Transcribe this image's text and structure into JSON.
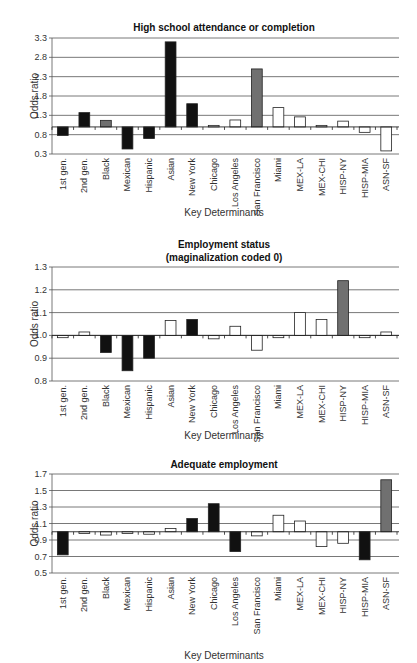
{
  "chart_data": [
    {
      "type": "bar",
      "title": "High school attendance or completion",
      "xlabel": "Key Determinants",
      "ylabel": "Odds ratio",
      "ylim": [
        0.3,
        3.3
      ],
      "yticks": [
        0.3,
        0.8,
        1.3,
        1.8,
        2.3,
        2.8,
        3.3
      ],
      "ytick_labels": [
        "0.3",
        "0.8",
        "1.3",
        "1.8",
        "2.3",
        "2.8",
        "3.3"
      ],
      "baseline": 1.0,
      "grid": true,
      "categories": [
        "1st gen.",
        "2nd gen.",
        "Black",
        "Mexican",
        "Hispanic",
        "Asian",
        "New York",
        "Chicago",
        "Los Angeles",
        "San Francisco",
        "Miami",
        "MEX-LA",
        "MEX-CHI",
        "HISP-NY",
        "HISP-MIA",
        "ASN-SF"
      ],
      "values": [
        0.78,
        1.37,
        1.17,
        0.43,
        0.7,
        3.2,
        1.6,
        1.04,
        1.18,
        2.5,
        1.5,
        1.26,
        1.04,
        1.15,
        0.86,
        0.38
      ],
      "bar_fills": [
        "black",
        "black",
        "gray",
        "black",
        "black",
        "black",
        "black",
        "white",
        "white",
        "gray",
        "white",
        "white",
        "white",
        "white",
        "white",
        "white"
      ]
    },
    {
      "type": "bar",
      "title": "Employment status",
      "subtitle": "(maginalization coded 0)",
      "xlabel": "Key Determinants",
      "ylabel": "Odds ratio",
      "ylim": [
        0.8,
        1.3
      ],
      "yticks": [
        0.8,
        0.9,
        1.0,
        1.1,
        1.2,
        1.3
      ],
      "ytick_labels": [
        "0.8",
        "0.9",
        "1.0",
        "1.1",
        "1.2",
        "1.3"
      ],
      "baseline": 1.0,
      "grid": true,
      "categories": [
        "1st gen.",
        "2nd gen.",
        "Black",
        "Mexican",
        "Hispanic",
        "Asian",
        "New York",
        "Chicago",
        "Los Angeles",
        "San Francisco",
        "Miami",
        "MEX-LA",
        "MEX-CHI",
        "HISP-NY",
        "HISP-MIA",
        "ASN-SF"
      ],
      "values": [
        0.99,
        1.015,
        0.925,
        0.845,
        0.9,
        1.065,
        1.07,
        0.985,
        1.04,
        0.935,
        0.99,
        1.1,
        1.07,
        1.24,
        0.99,
        1.015
      ],
      "bar_fills": [
        "white",
        "white",
        "black",
        "black",
        "black",
        "white",
        "black",
        "white",
        "white",
        "white",
        "white",
        "white",
        "white",
        "gray",
        "white",
        "white"
      ]
    },
    {
      "type": "bar",
      "title": "Adequate employment",
      "xlabel": "Key Determinants",
      "ylabel": "Odds ratio",
      "ylim": [
        0.5,
        1.7
      ],
      "yticks": [
        0.5,
        0.7,
        0.9,
        1.1,
        1.3,
        1.5,
        1.7
      ],
      "ytick_labels": [
        "0.5",
        "0.7",
        "0.9",
        "1.1",
        "1.3",
        "1.5",
        "1.7"
      ],
      "baseline": 1.0,
      "grid": true,
      "categories": [
        "1st gen.",
        "2nd gen.",
        "Black",
        "Mexican",
        "Hispanic",
        "Asian",
        "New York",
        "Chicago",
        "Los Angeles",
        "San Francisco",
        "Miami",
        "MEX-LA",
        "MEX-CHI",
        "HISP-NY",
        "HISP-MIA",
        "ASN-SF"
      ],
      "values": [
        0.72,
        0.98,
        0.96,
        0.98,
        0.97,
        1.04,
        1.16,
        1.34,
        0.76,
        0.95,
        1.2,
        1.13,
        0.82,
        0.86,
        0.66,
        1.63
      ],
      "bar_fills": [
        "black",
        "white",
        "white",
        "white",
        "white",
        "white",
        "black",
        "black",
        "black",
        "white",
        "white",
        "white",
        "white",
        "white",
        "black",
        "gray"
      ]
    }
  ],
  "colors": {
    "black": "#111111",
    "gray": "#707070",
    "white": "#ffffff",
    "grid": "#555555",
    "outline": "#222222"
  }
}
